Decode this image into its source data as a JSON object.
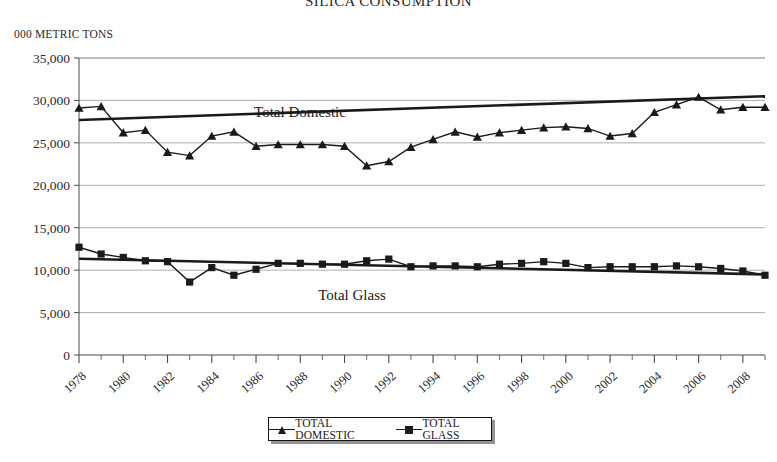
{
  "chart_data": {
    "type": "line",
    "title": "SILICA CONSUMPTION",
    "ylabel": "000 METRIC TONS",
    "xlabel": "",
    "ylim": [
      0,
      35000
    ],
    "ytick_labels": [
      "35,000",
      "30,000",
      "25,000",
      "20,000",
      "15,000",
      "10,000",
      "5,000",
      "0"
    ],
    "ytick_values": [
      35000,
      30000,
      25000,
      20000,
      15000,
      10000,
      5000,
      0
    ],
    "grid": true,
    "legend_position": "bottom",
    "x": [
      1978,
      1979,
      1980,
      1981,
      1982,
      1983,
      1984,
      1985,
      1986,
      1987,
      1988,
      1989,
      1990,
      1991,
      1992,
      1993,
      1994,
      1995,
      1996,
      1997,
      1998,
      1999,
      2000,
      2001,
      2002,
      2003,
      2004,
      2005,
      2006,
      2007,
      2008,
      2009
    ],
    "xtick_labels": [
      "1978",
      "1980",
      "1982",
      "1984",
      "1986",
      "1988",
      "1990",
      "1992",
      "1994",
      "1996",
      "1998",
      "2000",
      "2002",
      "2004",
      "2006",
      "2008"
    ],
    "xtick_values": [
      1978,
      1980,
      1982,
      1984,
      1986,
      1988,
      1990,
      1992,
      1994,
      1996,
      1998,
      2000,
      2002,
      2004,
      2006,
      2008
    ],
    "series": [
      {
        "name": "TOTAL DOMESTIC",
        "marker": "triangle",
        "annotation": "Total Domestic",
        "values": [
          29100,
          29300,
          26200,
          26500,
          23900,
          23500,
          25800,
          26300,
          24600,
          24800,
          24800,
          24800,
          24600,
          22300,
          22800,
          24500,
          25400,
          26300,
          25700,
          26200,
          26500,
          26800,
          26900,
          26700,
          25800,
          26100,
          28600,
          29500,
          30400,
          28900,
          29200,
          29200
        ]
      },
      {
        "name": "TOTAL GLASS",
        "marker": "square",
        "annotation": "Total Glass",
        "values": [
          12700,
          11900,
          11500,
          11100,
          11000,
          8600,
          10300,
          9400,
          10100,
          10800,
          10800,
          10700,
          10700,
          11100,
          11300,
          10400,
          10500,
          10500,
          10400,
          10700,
          10800,
          11000,
          10800,
          10300,
          10400,
          10400,
          10400,
          10500,
          10400,
          10200,
          9900,
          9400
        ]
      }
    ],
    "trendlines": [
      {
        "for": "TOTAL DOMESTIC",
        "start": 27700,
        "end": 30500
      },
      {
        "for": "TOTAL GLASS",
        "start": 11350,
        "end": 9500
      }
    ]
  },
  "legend": {
    "entries": [
      {
        "label": "TOTAL DOMESTIC",
        "marker": "triangle"
      },
      {
        "label": "TOTAL GLASS",
        "marker": "square"
      }
    ]
  }
}
